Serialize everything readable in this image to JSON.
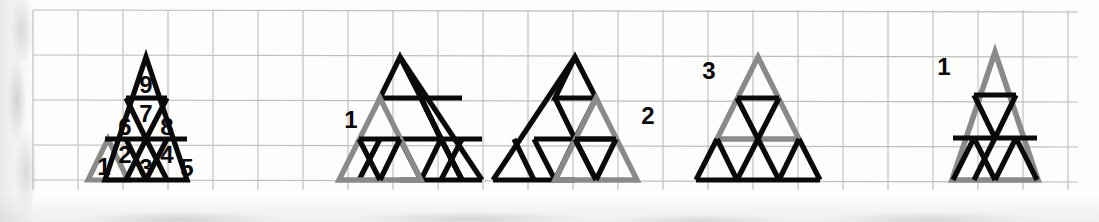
{
  "page": {
    "kind": "scanned-grid-paper-worksheet",
    "width": 1099,
    "height": 222,
    "background_color": "#fdfdfb",
    "grid_line_color": "#b4b4b4",
    "grid_spacing_px": 45,
    "grid_origin": {
      "x": 33,
      "y": 10
    },
    "grid_extent": {
      "x_end": 1078,
      "y_end": 190
    }
  },
  "colors": {
    "ink_black": "#0a0a0a",
    "highlight_gray": "#8a8a8a",
    "paper": "#fdfdfb",
    "grid": "#b4b4b4"
  },
  "figures": [
    {
      "id": "figure-1",
      "name": "nine-unit-triangles-numbered",
      "caption": "",
      "highlight": "detached-unit-triangle-left",
      "highlight_color": "#8a8a8a",
      "side_units": 3,
      "unit_labels": [
        "1",
        "2",
        "3",
        "4",
        "5",
        "6",
        "7",
        "8",
        "9"
      ],
      "detached_label": "1",
      "labels": [
        {
          "text": "9",
          "row": 0,
          "slot": 0
        },
        {
          "text": "7",
          "row": 1,
          "slot": 1
        },
        {
          "text": "6",
          "row": 1,
          "slot": 0
        },
        {
          "text": "8",
          "row": 1,
          "slot": 2
        },
        {
          "text": "2",
          "row": 2,
          "slot": 0
        },
        {
          "text": "3",
          "row": 2,
          "slot": 1
        },
        {
          "text": "4",
          "row": 2,
          "slot": 2
        },
        {
          "text": "5",
          "row": 2,
          "slot": 3
        }
      ]
    },
    {
      "id": "figure-2",
      "name": "lower-left-2x2-triangle-highlighted",
      "label": "1",
      "highlight": "lower-left-2x2",
      "highlight_color": "#8a8a8a",
      "side_units": 3
    },
    {
      "id": "figure-3",
      "name": "lower-right-2x2-triangle-highlighted",
      "label": "2",
      "highlight": "lower-right-2x2",
      "highlight_color": "#8a8a8a",
      "side_units": 3
    },
    {
      "id": "figure-4",
      "name": "top-2x2-triangle-highlighted",
      "label": "3",
      "highlight": "top-2x2",
      "highlight_color": "#8a8a8a",
      "side_units": 3
    },
    {
      "id": "figure-5",
      "name": "whole-3x3-triangle-highlighted",
      "label": "1",
      "highlight": "whole-3x3",
      "highlight_color": "#8a8a8a",
      "side_units": 3
    }
  ],
  "figure_labels": {
    "fig1_detached": "1",
    "fig2": "1",
    "fig3": "2",
    "fig4": "3",
    "fig5": "1"
  },
  "unit_numbers": {
    "n1": "1",
    "n2": "2",
    "n3": "3",
    "n4": "4",
    "n5": "5",
    "n6": "6",
    "n7": "7",
    "n8": "8",
    "n9": "9"
  }
}
